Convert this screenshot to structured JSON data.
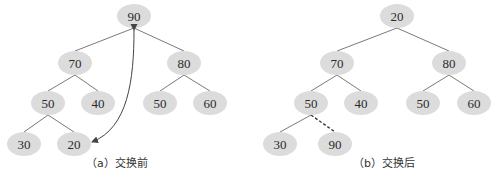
{
  "colors": {
    "node_fill": "#dcdcdc",
    "node_text": "#2a2a2a",
    "edge": "#7a7a7a",
    "arrow": "#444444",
    "dashed_edge": "#3a3a3a"
  },
  "diagrams": [
    {
      "id": "before",
      "caption": "（a）交换前",
      "nodes": [
        {
          "id": "a_root",
          "label": "90",
          "x": 134,
          "y": 16
        },
        {
          "id": "a_l",
          "label": "70",
          "x": 75,
          "y": 63
        },
        {
          "id": "a_r",
          "label": "80",
          "x": 184,
          "y": 63
        },
        {
          "id": "a_ll",
          "label": "50",
          "x": 48,
          "y": 103
        },
        {
          "id": "a_lr",
          "label": "40",
          "x": 98,
          "y": 103
        },
        {
          "id": "a_rl",
          "label": "50",
          "x": 160,
          "y": 103
        },
        {
          "id": "a_rr",
          "label": "60",
          "x": 210,
          "y": 103
        },
        {
          "id": "a_lll",
          "label": "30",
          "x": 24,
          "y": 144
        },
        {
          "id": "a_llr",
          "label": "20",
          "x": 74,
          "y": 144
        }
      ],
      "edges": [
        [
          "a_root",
          "a_l"
        ],
        [
          "a_root",
          "a_r"
        ],
        [
          "a_l",
          "a_ll"
        ],
        [
          "a_l",
          "a_lr"
        ],
        [
          "a_r",
          "a_rl"
        ],
        [
          "a_r",
          "a_rr"
        ],
        [
          "a_ll",
          "a_lll"
        ],
        [
          "a_ll",
          "a_llr"
        ]
      ],
      "swap_arrow": {
        "from": "a_root",
        "to": "a_llr",
        "style": "curved-double-headed"
      }
    },
    {
      "id": "after",
      "caption": "（b）交换后",
      "nodes": [
        {
          "id": "b_root",
          "label": "20",
          "x": 397,
          "y": 16
        },
        {
          "id": "b_l",
          "label": "70",
          "x": 337,
          "y": 63
        },
        {
          "id": "b_r",
          "label": "80",
          "x": 449,
          "y": 63
        },
        {
          "id": "b_ll",
          "label": "50",
          "x": 311,
          "y": 103
        },
        {
          "id": "b_lr",
          "label": "40",
          "x": 361,
          "y": 103
        },
        {
          "id": "b_rl",
          "label": "50",
          "x": 423,
          "y": 103
        },
        {
          "id": "b_rr",
          "label": "60",
          "x": 474,
          "y": 103
        },
        {
          "id": "b_lll",
          "label": "30",
          "x": 280,
          "y": 144
        },
        {
          "id": "b_llr",
          "label": "90",
          "x": 335,
          "y": 144
        }
      ],
      "edges": [
        [
          "b_root",
          "b_l"
        ],
        [
          "b_root",
          "b_r"
        ],
        [
          "b_l",
          "b_ll"
        ],
        [
          "b_l",
          "b_lr"
        ],
        [
          "b_r",
          "b_rl"
        ],
        [
          "b_r",
          "b_rr"
        ],
        [
          "b_ll",
          "b_lll"
        ]
      ],
      "dashed_edges": [
        [
          "b_ll",
          "b_llr"
        ]
      ]
    }
  ]
}
